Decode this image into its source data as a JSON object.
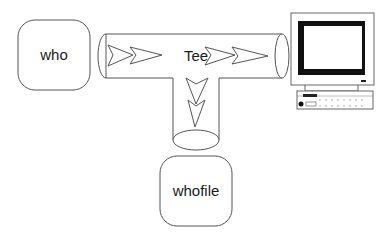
{
  "diagram": {
    "nodes": {
      "source": {
        "label": "who"
      },
      "tee": {
        "label": "Tee"
      },
      "file": {
        "label": "whofile"
      },
      "terminal": {
        "label": "",
        "icon": "computer-monitor-icon"
      }
    },
    "edges": [
      {
        "from": "who",
        "to": "Tee"
      },
      {
        "from": "Tee",
        "to": "terminal"
      },
      {
        "from": "Tee",
        "to": "whofile"
      }
    ],
    "colors": {
      "stroke": "#555555",
      "screen": "#111111",
      "background": "#ffffff"
    }
  }
}
